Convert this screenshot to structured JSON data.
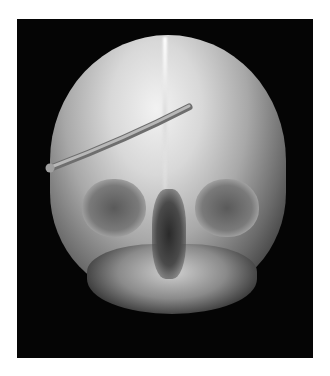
{
  "image": {
    "subject": "skull-xray",
    "description": "Frontal skull radiograph with a curved metal rod across the forehead",
    "colors": {
      "background": "#ffffff",
      "frame": "#050505",
      "bone": "#d8d8d8",
      "rod": "#9a9a9a"
    }
  }
}
